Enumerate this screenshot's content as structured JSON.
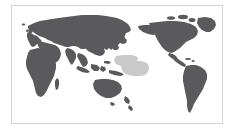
{
  "figure": {
    "type": "world-map",
    "title": "",
    "projection": "equirectangular, Pacific-centered",
    "center_longitude": 150,
    "frame": {
      "visible": true,
      "border_color": "#d4d4d4",
      "x": 11,
      "y": 5,
      "width": 212,
      "height": 119
    },
    "background_color": "#ffffff",
    "land_color": "#5a5a5c",
    "ocean_color": "#ffffff",
    "highlight_color": "#c9c9c9",
    "labels": [],
    "legend": {
      "visible": false,
      "entries": []
    },
    "graticule": {
      "visible": false
    },
    "landmasses": [
      {
        "name": "Africa"
      },
      {
        "name": "Europe"
      },
      {
        "name": "Asia"
      },
      {
        "name": "Australia"
      },
      {
        "name": "New Zealand"
      },
      {
        "name": "North America"
      },
      {
        "name": "South America"
      },
      {
        "name": "Greenland"
      },
      {
        "name": "Madagascar"
      },
      {
        "name": "Japan"
      },
      {
        "name": "Indonesia"
      },
      {
        "name": "British Isles"
      }
    ],
    "highlight_regions": [
      {
        "name": "Pacific Ocean highlight area",
        "region": "Micronesia / western Pacific",
        "color": "#c9c9c9"
      }
    ]
  }
}
